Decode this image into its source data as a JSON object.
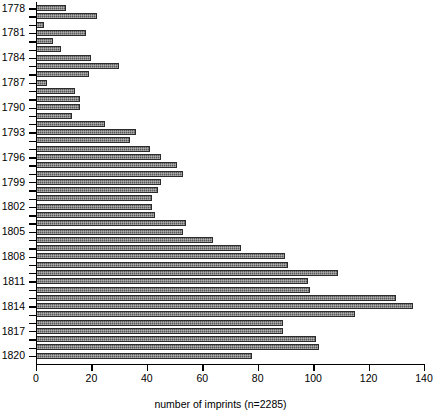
{
  "chart_data": {
    "type": "bar",
    "orientation": "horizontal",
    "title": "",
    "xlabel": "number of imprints (n=2285)",
    "ylabel": "",
    "xlim": [
      0,
      140
    ],
    "xticks": [
      0,
      20,
      40,
      60,
      80,
      100,
      120,
      140
    ],
    "grid": false,
    "legend": null,
    "total_n": 2285,
    "categories": [
      "1778",
      "1779",
      "1780",
      "1781",
      "1782",
      "1783",
      "1784",
      "1785",
      "1786",
      "1787",
      "1788",
      "1789",
      "1790",
      "1791",
      "1792",
      "1793",
      "1794",
      "1795",
      "1796",
      "1797",
      "1798",
      "1799",
      "1800",
      "1801",
      "1802",
      "1803",
      "1804",
      "1805",
      "1806",
      "1807",
      "1808",
      "1809",
      "1810",
      "1811",
      "1812",
      "1813",
      "1814",
      "1815",
      "1816",
      "1817",
      "1818",
      "1819",
      "1820"
    ],
    "ytick_labels": [
      "1778",
      "1781",
      "1784",
      "1787",
      "1790",
      "1793",
      "1796",
      "1799",
      "1802",
      "1805",
      "1808",
      "1811",
      "1814",
      "1817",
      "1820"
    ],
    "values": [
      11,
      22,
      3,
      18,
      6,
      9,
      20,
      30,
      19,
      4,
      14,
      16,
      16,
      13,
      25,
      36,
      34,
      41,
      45,
      51,
      53,
      45,
      44,
      42,
      42,
      43,
      54,
      53,
      64,
      74,
      90,
      91,
      109,
      98,
      99,
      130,
      136,
      115,
      89,
      89,
      101,
      102,
      78
    ]
  }
}
